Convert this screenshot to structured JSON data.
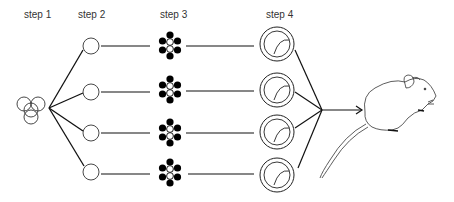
{
  "diagram": {
    "steps": [
      {
        "label": "step 1",
        "x": 24
      },
      {
        "label": "step 2",
        "x": 78
      },
      {
        "label": "step 3",
        "x": 160
      },
      {
        "label": "step 4",
        "x": 266
      }
    ],
    "branch_count": 4,
    "final_subject": "mouse-illustration",
    "colors": {
      "line": "#111111",
      "fill_dark": "#000000",
      "background": "#ffffff"
    }
  }
}
